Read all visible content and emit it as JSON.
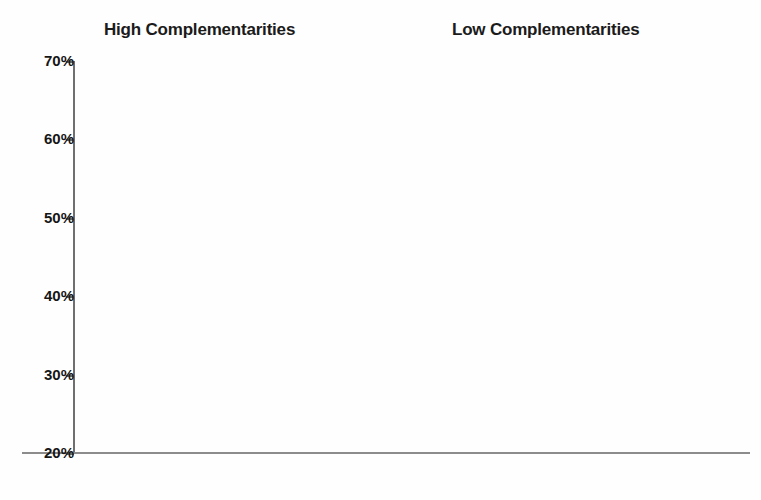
{
  "chart_data": {
    "type": "bar",
    "title": "",
    "xlabel": "",
    "ylabel": "",
    "ylim": [
      20,
      70
    ],
    "ytick_values": [
      70,
      60,
      50,
      40,
      30,
      20
    ],
    "ytick_labels": [
      "70%",
      "60%",
      "50%",
      "40%",
      "30%",
      "20%"
    ],
    "grid": false,
    "legend_position": "none",
    "panels": [
      {
        "title": "High Complementarities",
        "categories": [
          "High Overlap",
          "Low Overlap"
        ],
        "series": [
          {
            "name": "Series 1",
            "style": "white",
            "values": [
              35.0,
              45.0
            ]
          },
          {
            "name": "Series 2",
            "style": "light",
            "values": [
              26.9,
              35.6
            ]
          },
          {
            "name": "Series 3",
            "style": "medium",
            "values": [
              47.5,
              46.2
            ]
          },
          {
            "name": "Series 4",
            "style": "dark",
            "values": [
              40.3,
              48.6
            ]
          }
        ]
      },
      {
        "title": "Low Complementarities",
        "categories": [
          "High Overlap",
          "Low Overlap"
        ],
        "series": [
          {
            "name": "Series 1",
            "style": "white",
            "values": [
              66.0,
              69.0
            ]
          },
          {
            "name": "Series 2",
            "style": "light",
            "values": [
              52.5,
              48.5
            ]
          },
          {
            "name": "Series 3",
            "style": "medium",
            "values": [
              67.0,
              58.0
            ]
          },
          {
            "name": "Series 4",
            "style": "dark",
            "values": [
              64.2,
              60.4
            ]
          }
        ]
      }
    ],
    "colors": {
      "white": "#ffffff",
      "light": "#c2c2c2",
      "medium": "#878787",
      "dark": "#3a3a3a",
      "axis": "#6f6f6f",
      "text": "#161616"
    }
  },
  "layout": {
    "baseline_y": 453,
    "top_y": 61,
    "group_starts": [
      75,
      208,
      478,
      611
    ],
    "group_centers": [
      136,
      269,
      539,
      672
    ],
    "bar_width": 31,
    "group_width": 123
  }
}
